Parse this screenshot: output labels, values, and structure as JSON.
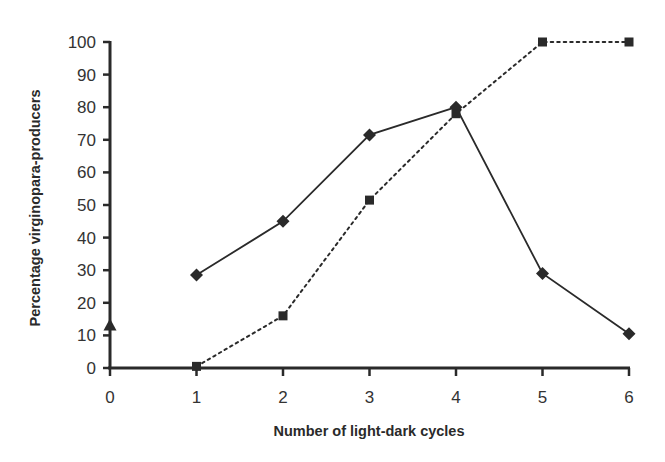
{
  "chart_data": {
    "type": "line",
    "title": "",
    "xlabel": "Number of light-dark cycles",
    "ylabel": "Percentage virginopara-producers",
    "x_ticks": [
      "0",
      "1",
      "2",
      "3",
      "4",
      "5",
      "6"
    ],
    "y_ticks": [
      "0",
      "10",
      "20",
      "30",
      "40",
      "50",
      "60",
      "70",
      "80",
      "90",
      "100"
    ],
    "xlim": [
      0,
      6
    ],
    "ylim": [
      0,
      100
    ],
    "grid": false,
    "legend": null,
    "series": [
      {
        "name": "diamond-solid",
        "marker": "diamond",
        "line_style": "solid",
        "x": [
          1,
          2,
          3,
          4,
          5,
          6
        ],
        "values": [
          28.5,
          45,
          71.5,
          80,
          29,
          10.5
        ]
      },
      {
        "name": "square-dotted",
        "marker": "square",
        "line_style": "dotted",
        "x": [
          1,
          2,
          3,
          4,
          5,
          6
        ],
        "values": [
          0.5,
          16,
          51.5,
          78,
          100,
          100
        ]
      },
      {
        "name": "triangle-point",
        "marker": "triangle",
        "line_style": "none",
        "x": [
          0
        ],
        "values": [
          13
        ]
      }
    ],
    "colors": {
      "ink": "#2a2a2a",
      "background": "#ffffff"
    }
  }
}
